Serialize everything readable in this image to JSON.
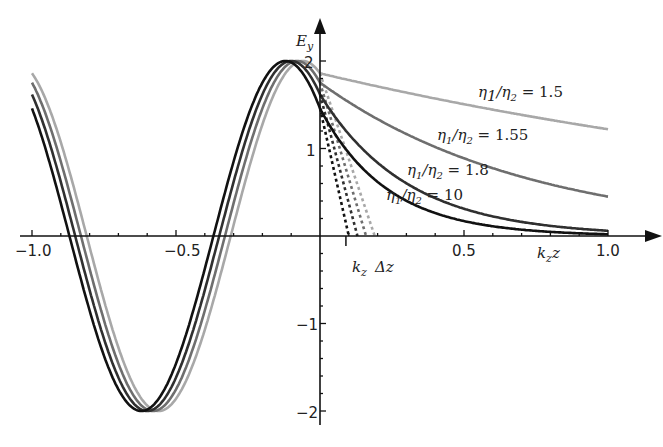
{
  "chart_data": {
    "type": "line",
    "title": "",
    "xlabel": "k_z z",
    "ylabel": "E_y",
    "xlim": [
      -1.0,
      1.05
    ],
    "ylim": [
      -2.1,
      2.2
    ],
    "x_ticks": [
      -1.0,
      -0.5,
      0.5,
      1.0
    ],
    "x_tick_labels": [
      "−1.0",
      "−0.5",
      "0.5",
      "1.0"
    ],
    "y_ticks": [
      -2,
      -1,
      1,
      2
    ],
    "y_tick_labels": [
      "−2",
      "−1",
      "1",
      "2"
    ],
    "grid": false,
    "legend": "inline annotations",
    "annotations": [
      {
        "text_main": "η",
        "sub1": "1",
        "slash": "/η",
        "sub2": "2",
        "eq": " = 1.5",
        "x": 0.55,
        "y": 1.65
      },
      {
        "text_main": "η",
        "sub1": "1",
        "slash": "/η",
        "sub2": "2",
        "eq": " = 1.55",
        "x": 0.41,
        "y": 1.13
      },
      {
        "text_main": "η",
        "sub1": "1",
        "slash": "/η",
        "sub2": "2",
        "eq": " = 1.8",
        "x": 0.3,
        "y": 0.7
      },
      {
        "text_main": "η",
        "sub1": "1",
        "slash": "/η",
        "sub2": "2",
        "eq": " = 10",
        "x": 0.21,
        "y": 0.36
      },
      {
        "text": "k_z Δz",
        "x": 0.05,
        "y": -0.35
      }
    ],
    "series": [
      {
        "name": "η1/η2 = 1.5",
        "color": "#a8a8a8",
        "region_left": "2cos(2π(x+0.06))",
        "peak_x": -0.06,
        "decay_end_value_at_1": 1.22,
        "tangent_zero": 0.19
      },
      {
        "name": "η1/η2 = 1.55",
        "color": "#6e6e6e",
        "region_left": "2cos(2π(x+0.08))",
        "peak_x": -0.08,
        "decay_end_value_at_1": 0.45,
        "tangent_zero": 0.16
      },
      {
        "name": "η1/η2 = 1.8",
        "color": "#303030",
        "region_left": "2cos(2π(x+0.1))",
        "peak_x": -0.1,
        "decay_end_value_at_1": 0.06,
        "tangent_zero": 0.13
      },
      {
        "name": "η1/η2 = 10",
        "color": "#111111",
        "region_left": "2cos(2π(x+0.12))",
        "peak_x": -0.12,
        "decay_end_value_at_1": 0.02,
        "tangent_zero": 0.1
      }
    ]
  },
  "labels": {
    "y_axis": "E",
    "y_axis_sub": "y",
    "x_axis_k": "k",
    "x_axis_sub": "z",
    "x_axis_z": "z",
    "dz_k": "k",
    "dz_sub": "z",
    "dz_delta": "Δz",
    "ann": [
      {
        "eta": "η",
        "s1": "1",
        "mid": "/η",
        "s2": "2",
        "val": " = 1.5"
      },
      {
        "eta": "η",
        "s1": "1",
        "mid": "/η",
        "s2": "2",
        "val": " = 1.55"
      },
      {
        "eta": "η",
        "s1": "1",
        "mid": "/η",
        "s2": "2",
        "val": " = 1.8"
      },
      {
        "eta": "η",
        "s1": "1",
        "mid": "/η",
        "s2": "2",
        "val": " = 10"
      }
    ],
    "xt": [
      "−1.0",
      "−0.5",
      "0.5",
      "1.0"
    ],
    "yt": [
      "2",
      "1",
      "−1",
      "−2"
    ]
  }
}
